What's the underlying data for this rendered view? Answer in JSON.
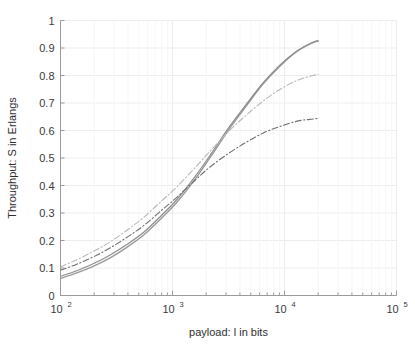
{
  "chart_data": {
    "type": "line",
    "title": "",
    "xlabel": "payload: l in bits",
    "ylabel": "Throughput: S in Erlangs",
    "xscale": "log",
    "yscale": "linear",
    "xlim": [
      100,
      100000
    ],
    "ylim": [
      0,
      1
    ],
    "grid": true,
    "legend": "none",
    "xticks": [
      100,
      1000,
      10000,
      100000
    ],
    "xticklabels": [
      "10^2",
      "10^3",
      "10^4",
      "10^5"
    ],
    "xtick_mantissas": [
      "10",
      "10",
      "10",
      "10"
    ],
    "xtick_exponents": [
      "2",
      "3",
      "4",
      "5"
    ],
    "yticks": [
      0,
      0.1,
      0.2,
      0.3,
      0.4,
      0.5,
      0.6,
      0.7,
      0.8,
      0.9,
      1
    ],
    "yticklabels": [
      "0",
      "0.1",
      "0.2",
      "0.3",
      "0.4",
      "0.5",
      "0.6",
      "0.7",
      "0.8",
      "0.9",
      "1"
    ],
    "series": [
      {
        "name": "series-solid-upper-a",
        "style": "solid",
        "color": "#9a9a9a",
        "width": 1.4,
        "x": [
          100,
          140,
          200,
          280,
          400,
          560,
          800,
          1100,
          1600,
          2200,
          3200,
          4500,
          6400,
          9000,
          13000,
          18000,
          20000
        ],
        "y": [
          0.062,
          0.082,
          0.108,
          0.138,
          0.178,
          0.222,
          0.282,
          0.34,
          0.424,
          0.506,
          0.604,
          0.686,
          0.768,
          0.832,
          0.888,
          0.92,
          0.925
        ]
      },
      {
        "name": "series-solid-upper-b",
        "style": "solid",
        "color": "#8d8d8d",
        "width": 1.2,
        "x": [
          100,
          140,
          200,
          280,
          400,
          560,
          800,
          1100,
          1600,
          2200,
          3200,
          4500,
          6400,
          9000,
          13000,
          18000,
          20000
        ],
        "y": [
          0.07,
          0.09,
          0.117,
          0.148,
          0.188,
          0.232,
          0.292,
          0.35,
          0.434,
          0.514,
          0.612,
          0.692,
          0.772,
          0.836,
          0.89,
          0.921,
          0.926
        ]
      },
      {
        "name": "series-dashdot-middle",
        "style": "dashdot",
        "color": "#b9b9b9",
        "width": 1.1,
        "x": [
          100,
          140,
          200,
          280,
          400,
          560,
          800,
          1100,
          1600,
          2200,
          3200,
          4500,
          6400,
          9000,
          13000,
          18000,
          20000
        ],
        "y": [
          0.104,
          0.13,
          0.162,
          0.196,
          0.24,
          0.286,
          0.344,
          0.396,
          0.466,
          0.528,
          0.598,
          0.654,
          0.706,
          0.748,
          0.782,
          0.8,
          0.804
        ]
      },
      {
        "name": "series-dashdot-lower",
        "style": "dashdot",
        "color": "#6f6f6f",
        "width": 1.1,
        "x": [
          100,
          140,
          200,
          280,
          400,
          560,
          800,
          1100,
          1600,
          2200,
          3200,
          4500,
          6400,
          9000,
          13000,
          18000,
          20000
        ],
        "y": [
          0.092,
          0.114,
          0.142,
          0.174,
          0.214,
          0.256,
          0.31,
          0.358,
          0.42,
          0.47,
          0.518,
          0.556,
          0.59,
          0.614,
          0.634,
          0.642,
          0.644
        ]
      }
    ]
  },
  "axes": {
    "y_axis_title": "Throughput: S in Erlangs",
    "x_axis_title": "payload: l in bits"
  },
  "colors": {
    "grid": "#ededed",
    "axis": "#9a9a9a",
    "text": "#333333",
    "background": "#ffffff"
  }
}
